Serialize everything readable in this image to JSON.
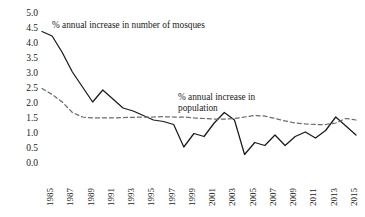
{
  "chart_data": {
    "type": "line",
    "title": "",
    "xlabel": "",
    "ylabel": "",
    "ylim": [
      0.0,
      5.0
    ],
    "ytick_step": 0.5,
    "yticks": [
      "5.0",
      "4.5",
      "4.0",
      "3.5",
      "3.0",
      "2.5",
      "2.0",
      "1.5",
      "1.0",
      "0.5",
      "0.0"
    ],
    "grid": false,
    "legend": "annotations-inline",
    "x": [
      1985,
      1986,
      1987,
      1988,
      1989,
      1990,
      1991,
      1992,
      1993,
      1994,
      1995,
      1996,
      1997,
      1998,
      1999,
      2000,
      2001,
      2002,
      2003,
      2004,
      2005,
      2006,
      2007,
      2008,
      2009,
      2010,
      2011,
      2012,
      2013,
      2014,
      2015,
      2016
    ],
    "xticks": [
      "1985",
      "1987",
      "1989",
      "1991",
      "1993",
      "1995",
      "1997",
      "1999",
      "2001",
      "2003",
      "2005",
      "2007",
      "2009",
      "2011",
      "2013",
      "2015"
    ],
    "series": [
      {
        "name": "% annual increase in number of mosques",
        "style": "solid",
        "color": "#1a1a1a",
        "values": [
          4.4,
          4.25,
          3.7,
          3.05,
          2.55,
          2.05,
          2.45,
          2.15,
          1.85,
          1.75,
          1.6,
          1.45,
          1.4,
          1.3,
          0.55,
          1.0,
          0.9,
          1.35,
          1.7,
          1.45,
          0.3,
          0.7,
          0.6,
          0.95,
          0.6,
          0.9,
          1.05,
          0.85,
          1.1,
          1.55,
          1.25,
          0.95
        ]
      },
      {
        "name": "% annual increase in population",
        "style": "dashed",
        "color": "#6b6b6b",
        "values": [
          2.5,
          2.3,
          2.05,
          1.7,
          1.55,
          1.52,
          1.52,
          1.52,
          1.53,
          1.54,
          1.55,
          1.55,
          1.56,
          1.55,
          1.55,
          1.52,
          1.5,
          1.48,
          1.48,
          1.5,
          1.55,
          1.6,
          1.58,
          1.5,
          1.42,
          1.35,
          1.32,
          1.3,
          1.3,
          1.35,
          1.5,
          1.45
        ]
      }
    ],
    "annotations": [
      {
        "id": "mosques",
        "text": "% annual increase in number of mosques"
      },
      {
        "id": "population_line1",
        "text": "% annual increase in"
      },
      {
        "id": "population_line2",
        "text": "population"
      }
    ]
  }
}
